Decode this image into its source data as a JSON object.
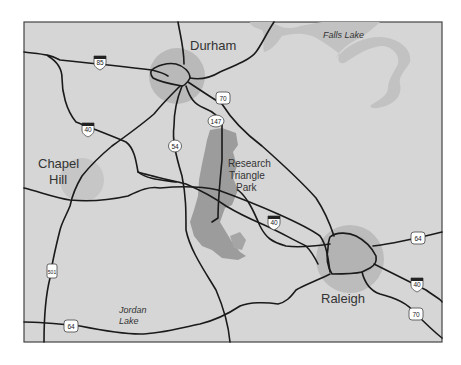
{
  "map": {
    "title": "Research Triangle Area Map",
    "colors": {
      "land": "#d6d6d6",
      "city_halo": "#b9b9b9",
      "rtp_area": "#9c9c9c",
      "lake": "#c2c2c2",
      "road": "#1a1a1a",
      "frame": "#444444"
    },
    "cities": [
      {
        "name": "Durham",
        "line1": "Durham",
        "line2": ""
      },
      {
        "name": "Chapel Hill",
        "line1": "Chapel",
        "line2": "Hill"
      },
      {
        "name": "Raleigh",
        "line1": "Raleigh",
        "line2": ""
      }
    ],
    "park": {
      "line1": "Research",
      "line2": "Triangle",
      "line3": "Park"
    },
    "lakes": [
      {
        "name": "Falls Lake",
        "line1": "Falls Lake",
        "line2": ""
      },
      {
        "name": "Jordan Lake",
        "line1": "Jordan",
        "line2": "Lake"
      }
    ],
    "shields": [
      {
        "route": "85",
        "type": "interstate"
      },
      {
        "route": "70",
        "type": "us"
      },
      {
        "route": "147",
        "type": "state"
      },
      {
        "route": "40",
        "type": "interstate"
      },
      {
        "route": "54",
        "type": "state"
      },
      {
        "route": "40",
        "type": "interstate"
      },
      {
        "route": "501",
        "type": "us"
      },
      {
        "route": "64",
        "type": "us"
      },
      {
        "route": "64",
        "type": "us"
      },
      {
        "route": "40",
        "type": "interstate"
      },
      {
        "route": "70",
        "type": "us"
      }
    ]
  }
}
